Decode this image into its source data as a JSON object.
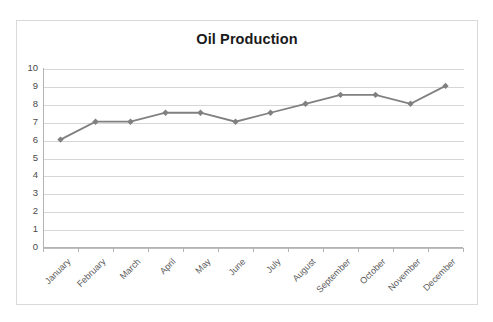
{
  "clipped_top_text": "",
  "chart": {
    "title": "Oil Production",
    "frame_border_color": "#d9d9d9",
    "gridline_color": "#d6d6d6",
    "axis_color": "#b3b3b3",
    "series_color": "#808080",
    "title_color": "#1a1a1a"
  },
  "chart_data": {
    "type": "line",
    "title": "Oil Production",
    "xlabel": "",
    "ylabel": "",
    "categories": [
      "January",
      "February",
      "March",
      "April",
      "May",
      "June",
      "July",
      "August",
      "September",
      "October",
      "November",
      "December"
    ],
    "values": [
      6,
      7,
      7,
      7.5,
      7.5,
      7,
      7.5,
      8,
      8.5,
      8.5,
      8,
      9
    ],
    "series": [
      {
        "name": "Oil Production",
        "values": [
          6,
          7,
          7,
          7.5,
          7.5,
          7,
          7.5,
          8,
          8.5,
          8.5,
          8,
          9
        ],
        "color": "#808080",
        "marker": "diamond"
      }
    ],
    "ylim": [
      0,
      10
    ],
    "ytick_labels": [
      "10",
      "9",
      "8",
      "7",
      "6",
      "5",
      "4",
      "3",
      "2",
      "1",
      "0"
    ],
    "ytick_values": [
      10,
      9,
      8,
      7,
      6,
      5,
      4,
      3,
      2,
      1,
      0
    ],
    "grid": true,
    "grid_axis": "y",
    "legend": false,
    "legend_position": "none",
    "xlabel_rotation": -45
  }
}
